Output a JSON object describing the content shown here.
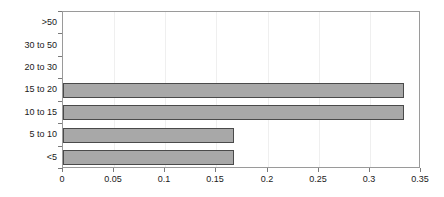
{
  "chart_data": {
    "type": "bar",
    "orientation": "horizontal",
    "title": "",
    "subtitle": "",
    "xlabel": "",
    "ylabel": "",
    "categories": [
      ">50",
      "30 to 50",
      "20 to 30",
      "15 to 20",
      "10 to 15",
      "5 to 10",
      "<5"
    ],
    "values": [
      0,
      0,
      0,
      0.333,
      0.333,
      0.167,
      0.167
    ],
    "xlim": [
      0,
      0.35
    ],
    "xticks": [
      0,
      0.05,
      0.1,
      0.15,
      0.2,
      0.25,
      0.3,
      0.35
    ],
    "xtick_labels": [
      "0",
      "0.05",
      "0.1",
      "0.15",
      "0.2",
      "0.25",
      "0.3",
      "0.35"
    ],
    "grid": "vertical",
    "legend": "none",
    "bar_color": "#a8a8a8",
    "bar_border_color": "#4a4a4a",
    "gridline_color": "#efefef",
    "frame_color": "#9a9a9a",
    "text_color": "#1a1a1a",
    "annotations": []
  }
}
